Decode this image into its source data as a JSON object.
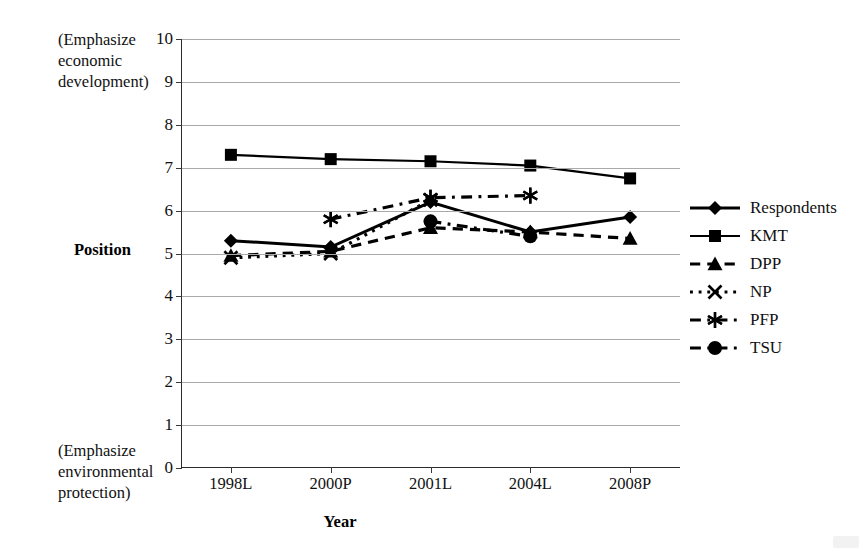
{
  "chart_data": {
    "type": "line",
    "title": "",
    "xlabel": "Year",
    "ylabel": "Position",
    "categories": [
      "1998L",
      "2000P",
      "2001L",
      "2004L",
      "2008P"
    ],
    "ylim": [
      0,
      10
    ],
    "yticks": [
      0,
      1,
      2,
      3,
      4,
      5,
      6,
      7,
      8,
      9,
      10
    ],
    "grid": true,
    "legend_position": "right",
    "annotations": {
      "top_left": "(Emphasize economic development)",
      "bottom_left": "(Emphasize environmental protection)"
    },
    "series": [
      {
        "name": "Respondents",
        "marker": "diamond",
        "line_style": "solid",
        "values": [
          5.3,
          5.15,
          6.2,
          5.5,
          5.85
        ]
      },
      {
        "name": "KMT",
        "marker": "square",
        "line_style": "solid",
        "values": [
          7.3,
          7.2,
          7.15,
          7.05,
          6.75
        ]
      },
      {
        "name": "DPP",
        "marker": "triangle",
        "line_style": "dashed",
        "values": [
          4.95,
          5.05,
          5.6,
          5.5,
          5.35
        ]
      },
      {
        "name": "NP",
        "marker": "cross",
        "line_style": "dotted",
        "values": [
          4.9,
          5.0,
          6.25,
          null,
          null
        ]
      },
      {
        "name": "PFP",
        "marker": "star",
        "line_style": "dash-dot",
        "values": [
          null,
          5.8,
          6.3,
          6.35,
          null
        ]
      },
      {
        "name": "TSU",
        "marker": "circle",
        "line_style": "dash-dot",
        "values": [
          null,
          null,
          5.75,
          5.4,
          null
        ]
      }
    ]
  },
  "axis": {
    "y_title": "Position",
    "x_title": "Year",
    "y_tick_labels": [
      "10",
      "9",
      "8",
      "7",
      "6",
      "5",
      "4",
      "3",
      "2",
      "1",
      "0"
    ],
    "x_tick_labels": [
      "1998L",
      "2000P",
      "2001L",
      "2004L",
      "2008P"
    ]
  },
  "notes": {
    "top": "(Emphasize economic development)",
    "bottom": "(Emphasize environmental protection)"
  },
  "legend": {
    "items": [
      {
        "label": "Respondents",
        "marker": "diamond",
        "line_style": "solid"
      },
      {
        "label": "KMT",
        "marker": "square",
        "line_style": "solid"
      },
      {
        "label": "DPP",
        "marker": "triangle",
        "line_style": "dashed"
      },
      {
        "label": "NP",
        "marker": "cross",
        "line_style": "dotted"
      },
      {
        "label": "PFP",
        "marker": "star",
        "line_style": "dash-dot"
      },
      {
        "label": "TSU",
        "marker": "circle",
        "line_style": "dash-dot"
      }
    ]
  },
  "colors": {
    "series": "#000000",
    "grid": "#a9a9a9",
    "axis": "#2b2b2b",
    "text": "#111111",
    "background": "#ffffff"
  }
}
